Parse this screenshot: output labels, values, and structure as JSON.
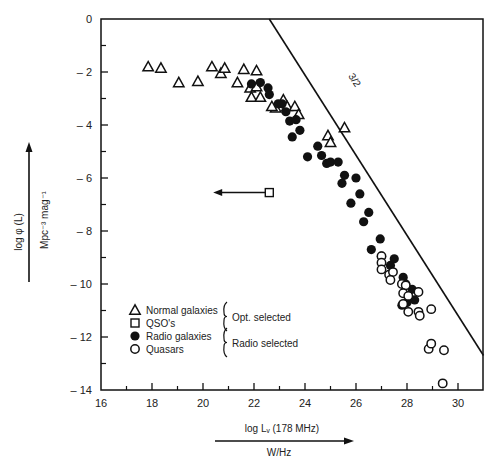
{
  "chart_data": {
    "type": "scatter",
    "title": "",
    "xlabel": "log L_ν (178 MHz)",
    "xlabel_unit": "W/Hz",
    "ylabel": "log φ (L)",
    "ylabel_unit": "Mpc^-3 mag^-1",
    "xlim": [
      16,
      31
    ],
    "ylim": [
      -14,
      0
    ],
    "x_major_ticks": [
      16,
      18,
      20,
      22,
      24,
      26,
      28,
      30
    ],
    "x_minor_ticks": [
      17,
      19,
      21,
      23,
      25,
      27,
      29
    ],
    "y_major_ticks": [
      0,
      -2,
      -4,
      -6,
      -8,
      -10,
      -12,
      -14
    ],
    "y_minor_ticks": [
      -1,
      -3,
      -5,
      -7,
      -9,
      -11,
      -13
    ],
    "x_tick_labels": [
      "16",
      "18",
      "20",
      "22",
      "24",
      "26",
      "28",
      "30"
    ],
    "y_tick_labels": [
      "0",
      "– 2",
      "– 4",
      "– 6",
      "– 8",
      "– 10",
      "– 12",
      "– 14"
    ],
    "grid": false,
    "reference_line": {
      "label": "3/2",
      "points": [
        [
          22.6,
          0
        ],
        [
          31.0,
          -12.7
        ]
      ]
    },
    "qso_upper_limit": {
      "x": 22.6,
      "y": -6.55,
      "arrow_to_x": 20.4,
      "label": "QSO's"
    },
    "series": [
      {
        "name": "Normal galaxies",
        "marker": "open-triangle",
        "points": [
          [
            17.85,
            -1.8
          ],
          [
            18.35,
            -1.85
          ],
          [
            19.05,
            -2.4
          ],
          [
            19.8,
            -2.35
          ],
          [
            20.35,
            -1.8
          ],
          [
            20.7,
            -2.05
          ],
          [
            20.85,
            -1.85
          ],
          [
            21.6,
            -1.9
          ],
          [
            21.35,
            -2.4
          ],
          [
            21.85,
            -2.6
          ],
          [
            22.1,
            -1.95
          ],
          [
            21.9,
            -2.95
          ],
          [
            22.1,
            -2.55
          ],
          [
            22.25,
            -2.95
          ],
          [
            22.85,
            -3.35
          ],
          [
            22.7,
            -3.3
          ],
          [
            23.15,
            -3.05
          ],
          [
            23.3,
            -3.3
          ],
          [
            23.6,
            -3.3
          ],
          [
            23.75,
            -3.6
          ],
          [
            24.9,
            -4.4
          ],
          [
            25.0,
            -4.65
          ],
          [
            25.55,
            -4.1
          ]
        ]
      },
      {
        "name": "Radio galaxies",
        "marker": "filled-circle",
        "points": [
          [
            21.9,
            -2.45
          ],
          [
            22.25,
            -2.4
          ],
          [
            22.55,
            -2.6
          ],
          [
            22.6,
            -2.85
          ],
          [
            22.95,
            -3.2
          ],
          [
            23.1,
            -3.2
          ],
          [
            23.25,
            -3.5
          ],
          [
            23.4,
            -3.85
          ],
          [
            23.65,
            -3.8
          ],
          [
            23.5,
            -4.45
          ],
          [
            23.8,
            -4.2
          ],
          [
            24.5,
            -4.8
          ],
          [
            24.65,
            -5.15
          ],
          [
            24.1,
            -5.2
          ],
          [
            24.85,
            -5.45
          ],
          [
            25.0,
            -5.4
          ],
          [
            25.3,
            -5.4
          ],
          [
            25.55,
            -5.9
          ],
          [
            25.45,
            -6.2
          ],
          [
            26.0,
            -6.0
          ],
          [
            26.15,
            -6.6
          ],
          [
            25.8,
            -6.95
          ],
          [
            26.5,
            -7.3
          ],
          [
            26.3,
            -7.65
          ],
          [
            26.95,
            -8.3
          ],
          [
            26.6,
            -8.7
          ],
          [
            27.0,
            -8.95
          ],
          [
            27.5,
            -9.05
          ],
          [
            27.35,
            -9.3
          ],
          [
            27.85,
            -9.75
          ],
          [
            27.95,
            -10.0
          ],
          [
            28.2,
            -10.2
          ],
          [
            28.3,
            -10.6
          ],
          [
            28.0,
            -10.7
          ],
          [
            27.8,
            -10.8
          ]
        ]
      },
      {
        "name": "Quasars",
        "marker": "open-circle",
        "points": [
          [
            27.0,
            -8.95
          ],
          [
            27.0,
            -9.2
          ],
          [
            27.0,
            -9.45
          ],
          [
            27.3,
            -9.65
          ],
          [
            27.45,
            -9.55
          ],
          [
            27.35,
            -9.85
          ],
          [
            27.8,
            -10.0
          ],
          [
            27.95,
            -10.05
          ],
          [
            27.85,
            -10.35
          ],
          [
            28.05,
            -10.45
          ],
          [
            28.45,
            -10.3
          ],
          [
            27.85,
            -10.75
          ],
          [
            28.05,
            -11.05
          ],
          [
            28.45,
            -11.05
          ],
          [
            28.5,
            -11.2
          ],
          [
            28.95,
            -10.95
          ],
          [
            28.85,
            -12.45
          ],
          [
            28.95,
            -12.25
          ],
          [
            29.45,
            -12.5
          ],
          [
            29.4,
            -13.75
          ]
        ]
      }
    ],
    "legend": {
      "position": "lower-left-inside",
      "entries": [
        {
          "marker": "open-triangle",
          "label": "Normal galaxies"
        },
        {
          "marker": "open-square",
          "label": "QSO's"
        },
        {
          "marker": "filled-circle",
          "label": "Radio galaxies"
        },
        {
          "marker": "open-circle",
          "label": "Quasars"
        }
      ],
      "groups": [
        {
          "label": "Opt. selected",
          "covers": [
            "Normal galaxies",
            "QSO's"
          ]
        },
        {
          "label": "Radio selected",
          "covers": [
            "Radio galaxies",
            "Quasars"
          ]
        }
      ]
    }
  },
  "labels": {
    "slope_label": "3/2",
    "y_axis_title": "log φ (L)",
    "y_axis_unit": "Mpc⁻³ mag⁻¹",
    "x_axis_title": "log Lᵥ (178 MHz)",
    "x_axis_unit": "W/Hz",
    "legend_normal": "Normal galaxies",
    "legend_qso": "QSO's",
    "legend_radio": "Radio galaxies",
    "legend_quasars": "Quasars",
    "group_opt": "Opt. selected",
    "group_radio": "Radio selected"
  },
  "colors": {
    "ink": "#111111",
    "background": "#ffffff"
  }
}
